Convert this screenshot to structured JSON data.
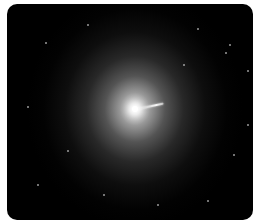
{
  "image": {
    "subject": "elliptical galaxy with relativistic jet",
    "frame": {
      "background": "#000000",
      "border_radius": 10,
      "page_background": "#ffffff"
    },
    "galaxy": {
      "center": [
        128,
        105
      ],
      "radius_x": 108,
      "radius_y": 118,
      "core_color": "#ffffff",
      "halo_color": "#9a9a9a"
    },
    "jet": {
      "start": [
        131,
        105
      ],
      "length": 26,
      "angle_deg": -12
    },
    "stars": [
      [
        38,
        38
      ],
      [
        80,
        20
      ],
      [
        190,
        24
      ],
      [
        222,
        40
      ],
      [
        240,
        66
      ],
      [
        218,
        48
      ],
      [
        60,
        146
      ],
      [
        20,
        102
      ],
      [
        226,
        150
      ],
      [
        200,
        196
      ],
      [
        96,
        190
      ],
      [
        150,
        200
      ],
      [
        30,
        180
      ],
      [
        176,
        60
      ],
      [
        240,
        120
      ]
    ]
  }
}
